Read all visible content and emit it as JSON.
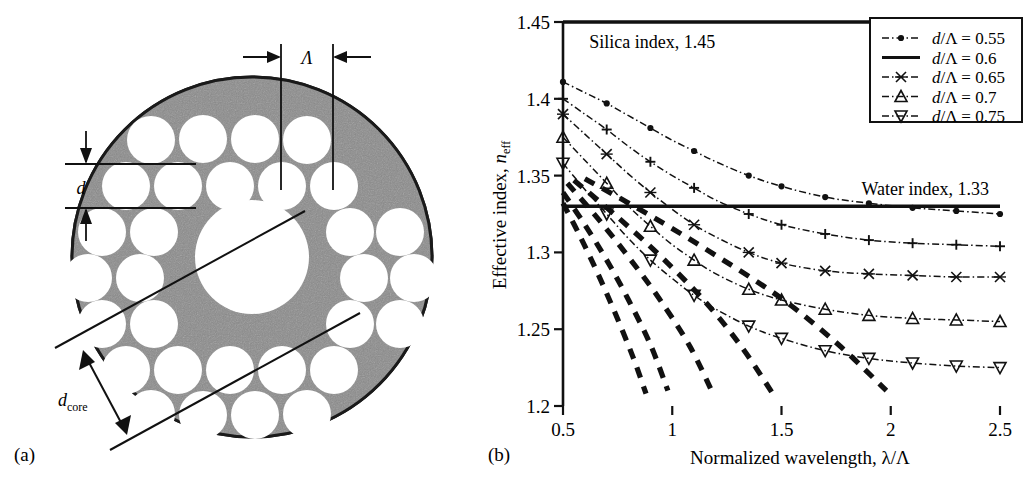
{
  "figure": {
    "panel_a_tag": "(a)",
    "panel_b_tag": "(b)"
  },
  "diagram": {
    "name": "photonic-crystal-fiber-cross-section",
    "labels": {
      "pitch": "Λ",
      "hole_diameter": "d",
      "core_diameter_base": "d",
      "core_diameter_sub": "core"
    },
    "colors": {
      "cladding_gray": "#8b8b8b",
      "hole_white": "#ffffff",
      "outline_black": "#111111"
    }
  },
  "chart_data": {
    "type": "line",
    "title": "",
    "xlabel_parts": {
      "text": "Normalized wavelength, ",
      "symbol": "λ/Λ"
    },
    "ylabel_parts": {
      "text": "Effective index, ",
      "symbol": "n",
      "sub": "eff"
    },
    "xlim": [
      0.5,
      2.5
    ],
    "ylim": [
      1.2,
      1.45
    ],
    "xticks": [
      "0.5",
      "1",
      "1.5",
      "2",
      "2.5"
    ],
    "xtick_values": [
      0.5,
      1,
      1.5,
      2,
      2.5
    ],
    "yticks": [
      "1.2",
      "1.25",
      "1.3",
      "1.35",
      "1.4",
      "1.45"
    ],
    "ytick_values": [
      1.2,
      1.25,
      1.3,
      1.35,
      1.4,
      1.45
    ],
    "grid": false,
    "legend_position": "top-right",
    "reference_lines": [
      {
        "name": "silica-index-line",
        "label": "Silica index, 1.45",
        "value": 1.45,
        "x_end": 2.32
      },
      {
        "name": "water-index-line",
        "label": "Water index, 1.33",
        "value": 1.33,
        "x_end": 2.5
      }
    ],
    "series": [
      {
        "name": "d/Λ = 0.55",
        "marker": "dot",
        "x": [
          0.5,
          0.6,
          0.7,
          0.8,
          0.9,
          1.0,
          1.1,
          1.2,
          1.35,
          1.5,
          1.7,
          1.9,
          2.1,
          2.3,
          2.5
        ],
        "y": [
          1.411,
          1.404,
          1.397,
          1.389,
          1.381,
          1.373,
          1.366,
          1.359,
          1.35,
          1.343,
          1.336,
          1.332,
          1.329,
          1.327,
          1.325
        ]
      },
      {
        "name": "d/Λ = 0.6",
        "marker": "plus",
        "x": [
          0.5,
          0.6,
          0.7,
          0.8,
          0.9,
          1.0,
          1.1,
          1.2,
          1.35,
          1.5,
          1.7,
          1.9,
          2.1,
          2.3,
          2.5
        ],
        "y": [
          1.4,
          1.39,
          1.38,
          1.369,
          1.359,
          1.35,
          1.342,
          1.334,
          1.325,
          1.318,
          1.312,
          1.308,
          1.306,
          1.305,
          1.304
        ]
      },
      {
        "name": "d/Λ = 0.65",
        "marker": "cross",
        "x": [
          0.5,
          0.6,
          0.7,
          0.8,
          0.9,
          1.0,
          1.1,
          1.2,
          1.35,
          1.5,
          1.7,
          1.9,
          2.1,
          2.3,
          2.5
        ],
        "y": [
          1.39,
          1.377,
          1.364,
          1.351,
          1.339,
          1.328,
          1.318,
          1.31,
          1.3,
          1.293,
          1.288,
          1.286,
          1.285,
          1.284,
          1.284
        ]
      },
      {
        "name": "d/Λ = 0.7",
        "marker": "triangle-up",
        "x": [
          0.5,
          0.6,
          0.7,
          0.8,
          0.9,
          1.0,
          1.1,
          1.2,
          1.35,
          1.5,
          1.7,
          1.9,
          2.1,
          2.3,
          2.5
        ],
        "y": [
          1.375,
          1.36,
          1.345,
          1.33,
          1.317,
          1.305,
          1.295,
          1.286,
          1.276,
          1.269,
          1.263,
          1.259,
          1.257,
          1.256,
          1.255
        ]
      },
      {
        "name": "d/Λ = 0.75",
        "marker": "triangle-down",
        "x": [
          0.5,
          0.6,
          0.7,
          0.8,
          0.9,
          1.0,
          1.1,
          1.2,
          1.35,
          1.5,
          1.7,
          1.9,
          2.1,
          2.3,
          2.5
        ],
        "y": [
          1.358,
          1.341,
          1.325,
          1.309,
          1.295,
          1.283,
          1.272,
          1.263,
          1.252,
          1.244,
          1.236,
          1.231,
          1.228,
          1.226,
          1.225
        ]
      }
    ],
    "cladding_mode_curves": [
      {
        "name": "cladding-mode-1",
        "x": [
          0.5,
          0.58,
          0.66,
          0.74,
          0.82,
          0.88
        ],
        "y": [
          1.332,
          1.31,
          1.286,
          1.26,
          1.232,
          1.208
        ]
      },
      {
        "name": "cladding-mode-2",
        "x": [
          0.5,
          0.6,
          0.7,
          0.8,
          0.9,
          0.98
        ],
        "y": [
          1.339,
          1.318,
          1.295,
          1.269,
          1.24,
          1.21
        ]
      },
      {
        "name": "cladding-mode-3",
        "x": [
          0.52,
          0.66,
          0.8,
          0.94,
          1.08,
          1.18
        ],
        "y": [
          1.345,
          1.322,
          1.297,
          1.27,
          1.239,
          1.21
        ]
      },
      {
        "name": "cladding-mode-4",
        "x": [
          0.55,
          0.75,
          0.95,
          1.15,
          1.32,
          1.46
        ],
        "y": [
          1.347,
          1.323,
          1.297,
          1.268,
          1.238,
          1.208
        ]
      },
      {
        "name": "cladding-mode-5",
        "x": [
          0.6,
          0.9,
          1.2,
          1.5,
          1.76,
          1.98
        ],
        "y": [
          1.348,
          1.324,
          1.298,
          1.27,
          1.24,
          1.21
        ]
      }
    ]
  },
  "legend": {
    "name": "series-legend",
    "entries": [
      {
        "label": "d/Λ = 0.55",
        "marker": "dot"
      },
      {
        "label": "d/Λ = 0.6",
        "marker": "plain"
      },
      {
        "label": "d/Λ = 0.65",
        "marker": "cross"
      },
      {
        "label": "d/Λ = 0.7",
        "marker": "triangle-up"
      },
      {
        "label": "d/Λ = 0.75",
        "marker": "triangle-down"
      }
    ]
  }
}
